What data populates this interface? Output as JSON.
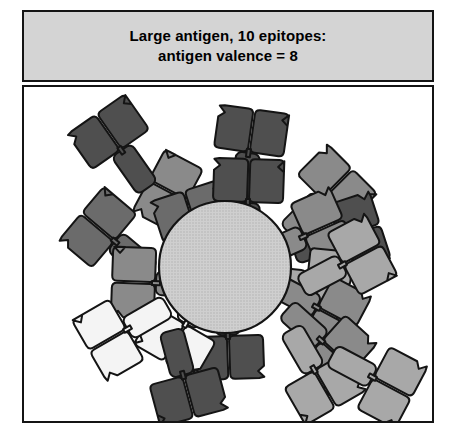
{
  "figure": {
    "title_line1": "Large antigen, 10 epitopes:",
    "title_line2": "antigen valence = 8",
    "title": "Large antigen, 10 epitopes:\nantigen valence = 8",
    "frame_border_color": "#141414",
    "title_panel_fill": "#d4d4d4",
    "diagram_panel_fill": "#ffffff"
  },
  "legend_values": {
    "epitopes": 10,
    "antigen_valence": 8,
    "antibodies_drawn": 20,
    "antibodies_bound": 8
  },
  "antigen": {
    "label": "antigen-sphere",
    "shape": "circle",
    "cx": 201,
    "cy": 180,
    "r": 66,
    "fill": "#c6c6c6",
    "stroke": "#141414",
    "texture": "halftone-dots"
  },
  "palette": {
    "dark": "#4f4f4f",
    "mid_dark": "#6b6b6b",
    "mid": "#8a8a8a",
    "light": "#a8a8a8",
    "pale": "#d8d8d8",
    "white": "#f4f4f4",
    "outline": "#141414"
  },
  "antibodies": [
    {
      "name": "antibody-01",
      "x": 95,
      "y": 60,
      "rot": -35,
      "tone": "dark",
      "bound": false
    },
    {
      "name": "antibody-02",
      "x": 225,
      "y": 62,
      "rot": 8,
      "tone": "dark",
      "bound": false
    },
    {
      "name": "antibody-03",
      "x": 160,
      "y": 112,
      "rot": -62,
      "tone": "mid",
      "bound": false
    },
    {
      "name": "antibody-04",
      "x": 88,
      "y": 152,
      "rot": -50,
      "tone": "mid_dark",
      "bound": false
    },
    {
      "name": "antibody-05",
      "x": 300,
      "y": 110,
      "rot": 45,
      "tone": "mid",
      "bound": false
    },
    {
      "name": "antibody-06",
      "x": 318,
      "y": 150,
      "rot": 72,
      "tone": "dark",
      "bound": false
    },
    {
      "name": "antibody-07",
      "x": 172,
      "y": 142,
      "rot": -18,
      "tone": "mid_dark",
      "bound": true
    },
    {
      "name": "antibody-08",
      "x": 224,
      "y": 112,
      "rot": 2,
      "tone": "dark",
      "bound": true
    },
    {
      "name": "antibody-09",
      "x": 283,
      "y": 148,
      "rot": 66,
      "tone": "mid",
      "bound": true
    },
    {
      "name": "antibody-10",
      "x": 128,
      "y": 196,
      "rot": -88,
      "tone": "mid",
      "bound": true
    },
    {
      "name": "antibody-11",
      "x": 286,
      "y": 196,
      "rot": 96,
      "tone": "light",
      "bound": true
    },
    {
      "name": "antibody-12",
      "x": 296,
      "y": 222,
      "rot": 118,
      "tone": "mid",
      "bound": true
    },
    {
      "name": "antibody-13",
      "x": 204,
      "y": 252,
      "rot": 178,
      "tone": "dark",
      "bound": true
    },
    {
      "name": "antibody-14",
      "x": 160,
      "y": 240,
      "rot": -150,
      "tone": "white",
      "bound": true
    },
    {
      "name": "antibody-15",
      "x": 100,
      "y": 244,
      "rot": -120,
      "tone": "white",
      "bound": false
    },
    {
      "name": "antibody-16",
      "x": 160,
      "y": 292,
      "rot": 165,
      "tone": "dark",
      "bound": false
    },
    {
      "name": "antibody-17",
      "x": 300,
      "y": 256,
      "rot": 132,
      "tone": "mid",
      "bound": false
    },
    {
      "name": "antibody-18",
      "x": 322,
      "y": 176,
      "rot": 62,
      "tone": "light",
      "bound": false
    },
    {
      "name": "antibody-19",
      "x": 292,
      "y": 286,
      "rot": 150,
      "tone": "light",
      "bound": false
    },
    {
      "name": "antibody-20",
      "x": 352,
      "y": 292,
      "rot": 118,
      "tone": "light",
      "bound": false
    }
  ]
}
